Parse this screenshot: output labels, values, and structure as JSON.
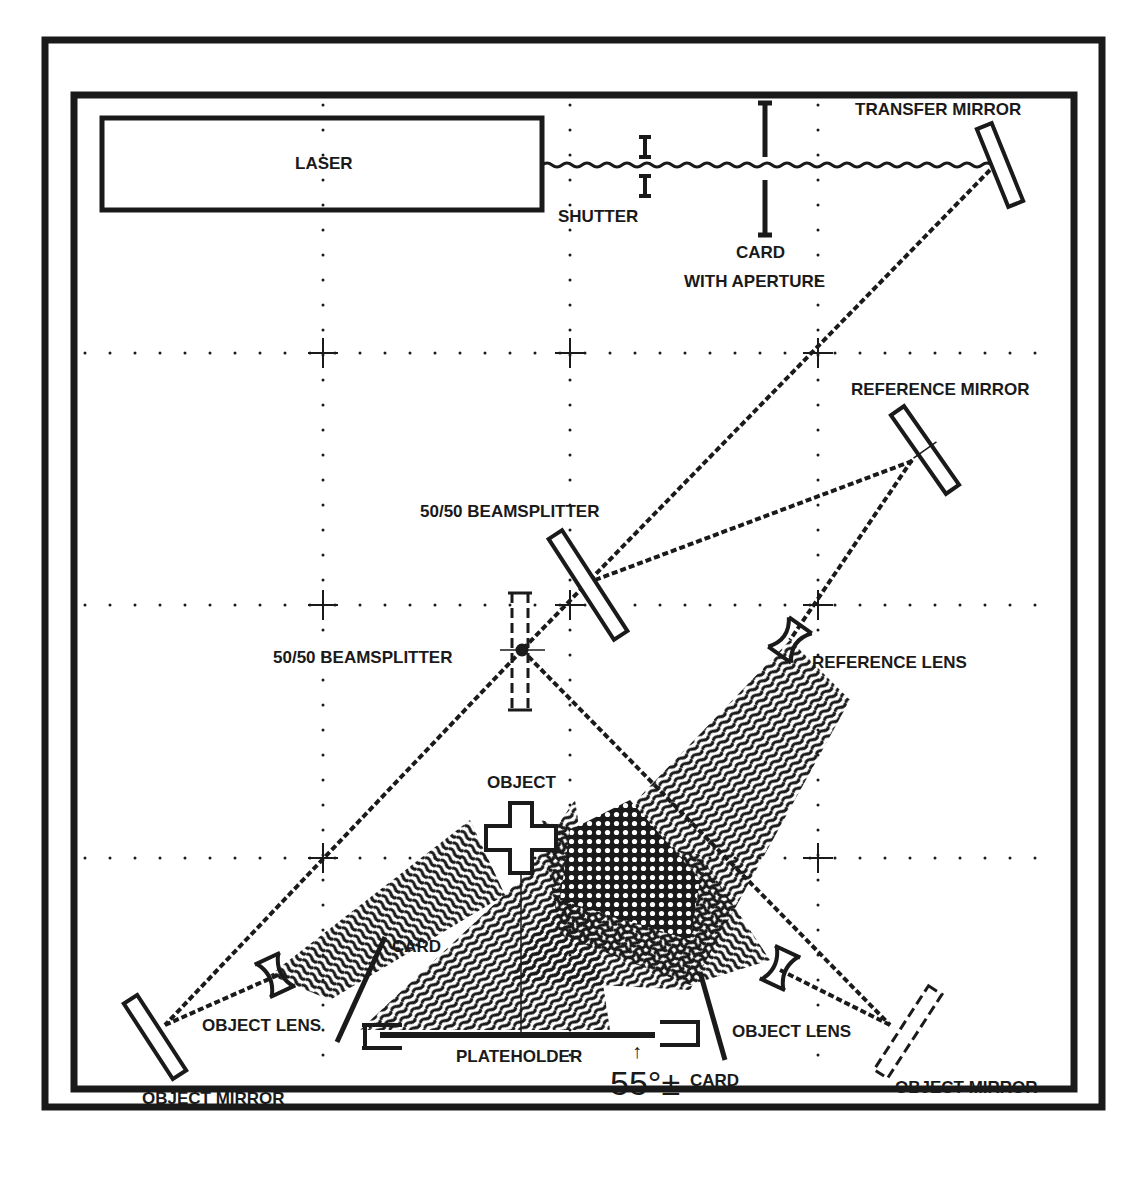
{
  "diagram": {
    "type": "holography optical table layout",
    "colors": {
      "ink": "#1a1a1a",
      "paper": "#ffffff"
    },
    "components": {
      "laser": {
        "label": "LASER"
      },
      "shutter": {
        "label": "SHUTTER"
      },
      "card_aperture": {
        "label_line1": "CARD",
        "label_line2": "WITH APERTURE"
      },
      "transfer_mirror": {
        "label": "TRANSFER MIRROR"
      },
      "reference_mirror": {
        "label": "REFERENCE MIRROR"
      },
      "beamsplitter_upper": {
        "label": "50/50 BEAMSPLITTER"
      },
      "beamsplitter_lower": {
        "label": "50/50 BEAMSPLITTER"
      },
      "reference_lens": {
        "label": "REFERENCE LENS"
      },
      "object": {
        "label": "OBJECT"
      },
      "card_left": {
        "label": "CARD"
      },
      "card_right": {
        "label": "CARD"
      },
      "object_lens_left": {
        "label": "OBJECT LENS"
      },
      "object_lens_right": {
        "label": "OBJECT LENS"
      },
      "object_mirror_left": {
        "label": "OBJECT MIRROR"
      },
      "object_mirror_right": {
        "label": "OBJECT MIRROR"
      },
      "plateholder": {
        "label": "PLATEHOLDER"
      },
      "angle": {
        "label": "55°±"
      }
    },
    "grid": {
      "rows_y": [
        353,
        605,
        858
      ],
      "cols_x": [
        323,
        570,
        818
      ]
    }
  }
}
